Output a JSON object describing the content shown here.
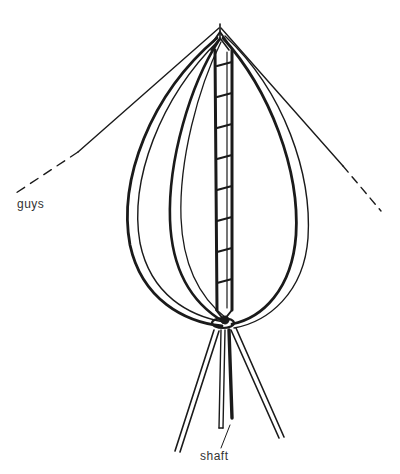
{
  "diagram": {
    "labels": {
      "guys": "guys",
      "shaft": "shaft"
    },
    "colors": {
      "ink": "#1a1a1a",
      "label": "#333333",
      "background": "#ffffff"
    }
  }
}
